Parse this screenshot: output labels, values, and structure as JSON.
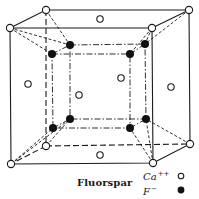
{
  "diagram": {
    "caption": "Fluorspar",
    "legend": [
      {
        "ion": "Ca",
        "charge": "++",
        "marker": "open-circle"
      },
      {
        "ion": "F",
        "charge": "−",
        "marker": "filled-circle"
      }
    ],
    "colors": {
      "ink": "#1a1a1a",
      "background": "#ffffff"
    }
  }
}
